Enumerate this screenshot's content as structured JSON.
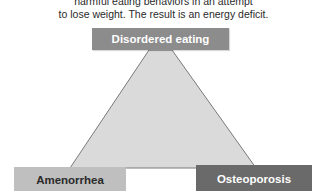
{
  "caption": {
    "line1": "harmful eating behaviors in an attempt",
    "line2": "to lose weight. The result is an energy deficit."
  },
  "triad": {
    "top": "Disordered eating",
    "bottom_left": "Amenorrhea",
    "bottom_right": "Osteoporosis"
  },
  "colors": {
    "top_box": "#8c8c8c",
    "left_box": "#bfbfbf",
    "right_box": "#6a6a6a",
    "triangle_fill": "#dadada",
    "triangle_stroke": "#7a7a7a"
  }
}
